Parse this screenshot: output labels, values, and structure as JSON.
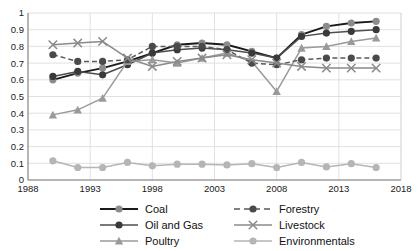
{
  "chart_data": {
    "type": "line",
    "title": "",
    "xlabel": "",
    "ylabel": "",
    "xlim": [
      1988,
      2018
    ],
    "ylim": [
      0,
      1
    ],
    "grid": true,
    "legend_position": "bottom",
    "x_ticks": [
      "1988",
      "1993",
      "1998",
      "2003",
      "2008",
      "2013",
      "2018"
    ],
    "y_ticks": [
      "0",
      "0.1",
      "0.2",
      "0.3",
      "0.4",
      "0.5",
      "0.6",
      "0.7",
      "0.8",
      "0.9",
      "1"
    ],
    "x": [
      1990,
      1992,
      1994,
      1996,
      1998,
      2000,
      2002,
      2004,
      2006,
      2008,
      2010,
      2012,
      2014,
      2016
    ],
    "series": [
      {
        "name": "Coal",
        "color": "#1a1a1a",
        "marker": "circle",
        "marker_color": "#8c8c8c",
        "dash": "solid",
        "values": [
          0.6,
          0.64,
          0.67,
          0.71,
          0.76,
          0.81,
          0.82,
          0.81,
          0.77,
          0.73,
          0.87,
          0.92,
          0.94,
          0.95
        ]
      },
      {
        "name": "Oil and Gas",
        "color": "#4d4d4d",
        "marker": "circle",
        "marker_color": "#3a3a3a",
        "dash": "solid",
        "values": [
          0.62,
          0.65,
          0.63,
          0.69,
          0.76,
          0.78,
          0.79,
          0.78,
          0.76,
          0.73,
          0.86,
          0.88,
          0.89,
          0.9
        ]
      },
      {
        "name": "Poultry",
        "color": "#9a9a9a",
        "marker": "triangle",
        "marker_color": "#9a9a9a",
        "dash": "solid",
        "values": [
          0.39,
          0.42,
          0.49,
          0.71,
          0.72,
          0.7,
          0.73,
          0.76,
          0.71,
          0.53,
          0.79,
          0.8,
          0.83,
          0.85
        ]
      },
      {
        "name": "Forestry",
        "color": "#5a5a5a",
        "marker": "circle",
        "marker_color": "#4a4a4a",
        "dash": "dashed",
        "values": [
          0.75,
          0.71,
          0.71,
          0.72,
          0.8,
          0.8,
          0.8,
          0.78,
          0.7,
          0.69,
          0.72,
          0.73,
          0.73,
          0.73
        ]
      },
      {
        "name": "Livestock",
        "color": "#8a8a8a",
        "marker": "cross",
        "marker_color": "#8a8a8a",
        "dash": "solid",
        "values": [
          0.81,
          0.82,
          0.83,
          0.73,
          0.68,
          0.71,
          0.73,
          0.75,
          0.72,
          0.7,
          0.68,
          0.67,
          0.67,
          0.67
        ]
      },
      {
        "name": "Environmentals",
        "color": "#b5b5b5",
        "marker": "circle",
        "marker_color": "#b5b5b5",
        "dash": "solid",
        "values": [
          0.115,
          0.075,
          0.075,
          0.105,
          0.085,
          0.095,
          0.095,
          0.09,
          0.098,
          0.075,
          0.105,
          0.078,
          0.098,
          0.075
        ]
      }
    ]
  },
  "legend": {
    "left_column": [
      "Coal",
      "Oil and Gas",
      "Poultry"
    ],
    "right_column": [
      "Forestry",
      "Livestock",
      "Environmentals"
    ]
  }
}
